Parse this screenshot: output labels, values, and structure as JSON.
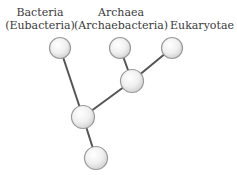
{
  "diagram": {
    "type": "phylogenetic-tree",
    "labels": {
      "bacteria": {
        "line1": "Bacteria",
        "line2": "(Eubacteria)"
      },
      "archaea": {
        "line1": "Archaea",
        "line2": "(Archaebacteria)"
      },
      "eukaryotes": {
        "line1": "Eukaryotae"
      }
    },
    "nodes": [
      {
        "id": "bacteria",
        "cx": 60,
        "cy": 48
      },
      {
        "id": "archaea",
        "cx": 120,
        "cy": 48
      },
      {
        "id": "eukaryotes",
        "cx": 172,
        "cy": 48
      },
      {
        "id": "archaea-eukaryote-ancestor",
        "cx": 132,
        "cy": 81
      },
      {
        "id": "common-ancestor",
        "cx": 83,
        "cy": 117
      },
      {
        "id": "root",
        "cx": 96,
        "cy": 158
      }
    ],
    "edges": [
      [
        "bacteria",
        "common-ancestor"
      ],
      [
        "archaea",
        "archaea-eukaryote-ancestor"
      ],
      [
        "eukaryotes",
        "archaea-eukaryote-ancestor"
      ],
      [
        "archaea-eukaryote-ancestor",
        "common-ancestor"
      ],
      [
        "common-ancestor",
        "root"
      ]
    ],
    "colors": {
      "edge": "#555555",
      "node_fill_center": "#ffffff",
      "node_fill_edge": "#d8d8d8",
      "node_stroke": "#9a9a9a",
      "text": "#3a3a3a"
    }
  }
}
